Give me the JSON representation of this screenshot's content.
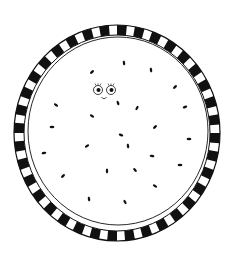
{
  "illustration": {
    "subject": "watermelon-slice",
    "colors": {
      "background": "#ffffff",
      "ink": "#111111"
    },
    "rind": {
      "cx": 117,
      "cy": 133,
      "rx": 103,
      "ry": 108,
      "band": 10,
      "segments": 36
    },
    "flesh": {
      "cx": 118,
      "cy": 131,
      "rx": 90,
      "ry": 94
    },
    "face": {
      "left_eye": {
        "cx": 98,
        "cy": 90
      },
      "right_eye": {
        "cx": 111,
        "cy": 90
      },
      "mouth": {
        "cx": 104,
        "cy": 98
      }
    },
    "seeds": [
      [
        124,
        63,
        80
      ],
      [
        92,
        72,
        -40
      ],
      [
        151,
        70,
        80
      ],
      [
        175,
        87,
        -40
      ],
      [
        56,
        105,
        35
      ],
      [
        118,
        103,
        70
      ],
      [
        137,
        108,
        -60
      ],
      [
        185,
        107,
        -20
      ],
      [
        92,
        116,
        30
      ],
      [
        52,
        127,
        0
      ],
      [
        155,
        127,
        -40
      ],
      [
        121,
        135,
        20
      ],
      [
        189,
        139,
        0
      ],
      [
        87,
        146,
        -30
      ],
      [
        128,
        146,
        80
      ],
      [
        44,
        153,
        -10
      ],
      [
        152,
        156,
        10
      ],
      [
        180,
        165,
        0
      ],
      [
        107,
        171,
        90
      ],
      [
        135,
        170,
        50
      ],
      [
        63,
        176,
        -40
      ],
      [
        155,
        186,
        30
      ],
      [
        89,
        199,
        80
      ],
      [
        125,
        202,
        60
      ]
    ]
  }
}
